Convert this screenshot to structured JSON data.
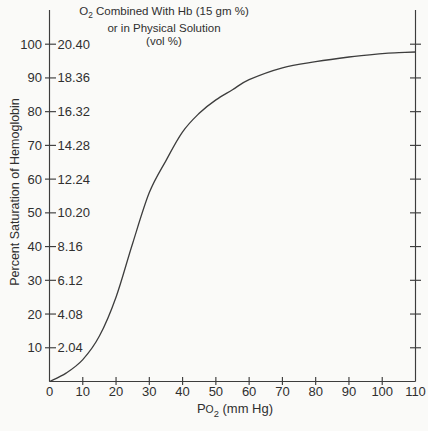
{
  "title": {
    "o2_base": "O",
    "o2_sub": "2",
    "line1_rest": " Combined With Hb (15 gm %)",
    "line2": "or in Physical Solution",
    "line3": "(vol %)"
  },
  "xlabel": {
    "p": "P",
    "o": "O",
    "sub": "2",
    "rest": " (mm Hg)"
  },
  "colors": {
    "background": "#fafaf8",
    "ink": "#3d3d3d",
    "text": "#2f2f2f"
  },
  "chart_data": {
    "type": "line",
    "title": "O2 Combined With Hb (15 gm %) or in Physical Solution (vol %)",
    "xlabel": "PO2 (mm Hg)",
    "ylabel": "Percent Saturation of Hemoglobin",
    "xlim": [
      0,
      110
    ],
    "ylim": [
      0,
      100
    ],
    "grid": false,
    "legend": null,
    "x_ticks": [
      0,
      10,
      20,
      30,
      40,
      50,
      60,
      70,
      80,
      90,
      100,
      110
    ],
    "y_ticks": [
      {
        "percent": 10,
        "vol": "2.04"
      },
      {
        "percent": 20,
        "vol": "4.08"
      },
      {
        "percent": 30,
        "vol": "6.12"
      },
      {
        "percent": 40,
        "vol": "8.16"
      },
      {
        "percent": 50,
        "vol": "10.20"
      },
      {
        "percent": 60,
        "vol": "12.24"
      },
      {
        "percent": 70,
        "vol": "14.28"
      },
      {
        "percent": 80,
        "vol": "16.32"
      },
      {
        "percent": 90,
        "vol": "18.36"
      },
      {
        "percent": 100,
        "vol": "20.40"
      }
    ],
    "series": [
      {
        "name": "oxyhemoglobin dissociation curve",
        "x": [
          0,
          5,
          10,
          15,
          20,
          25,
          30,
          35,
          40,
          45,
          50,
          55,
          60,
          70,
          80,
          90,
          100,
          105,
          110
        ],
        "y": [
          0,
          2.5,
          6.5,
          13.5,
          25,
          41,
          56,
          65.5,
          74,
          79.5,
          83.5,
          86.5,
          89.5,
          93,
          94.8,
          96.2,
          97.2,
          97.5,
          97.7
        ]
      }
    ]
  }
}
